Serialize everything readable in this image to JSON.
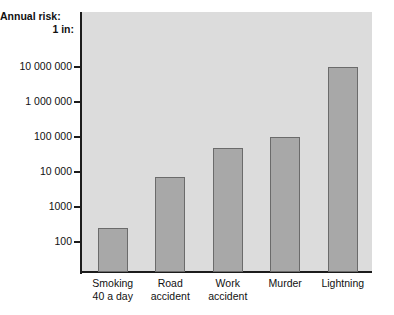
{
  "chart_data": {
    "type": "bar",
    "title": "",
    "subtitle": "",
    "ylabel": "Annual risk: 1 in:",
    "ylabel_line1": "Annual risk:",
    "ylabel_line2": "1 in:",
    "xlabel": "",
    "scale": "log",
    "grid": false,
    "legend": false,
    "ylim": [
      100,
      10000000
    ],
    "ytick_labels": [
      "10 000 000",
      "1 000 000",
      "100 000",
      "10 000",
      "1000",
      "100"
    ],
    "ytick_values": [
      10000000,
      1000000,
      100000,
      10000,
      1000,
      100
    ],
    "categories": [
      "Smoking 40 a day",
      "Road accident",
      "Work accident",
      "Murder",
      "Lightning"
    ],
    "category_lines": [
      [
        "Smoking",
        "40 a day"
      ],
      [
        "Road",
        "accident"
      ],
      [
        "Work",
        "accident"
      ],
      [
        "Murder"
      ],
      [
        "Lightning"
      ]
    ],
    "values": [
      250,
      7000,
      50000,
      100000,
      10000000
    ],
    "colors": {
      "bar_fill": "#a8a8a8",
      "bar_border": "#6b6b6b",
      "plot_background": "#dcdcdc",
      "page_background": "#ffffff",
      "axis": "#1c1c1c",
      "text": "#111111"
    }
  }
}
